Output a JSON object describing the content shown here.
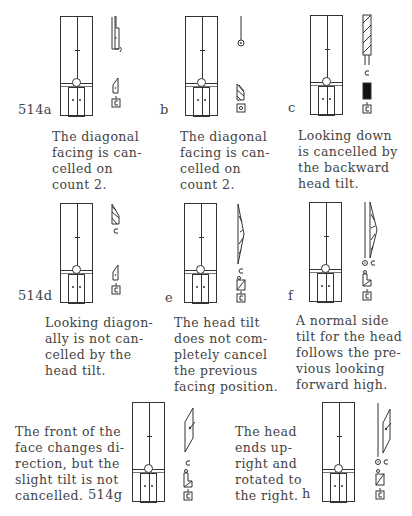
{
  "page": {
    "top_cut_text": "…",
    "figures": [
      {
        "id": "a",
        "label": "514a",
        "caption": "The diagonal\nfacing is can-\ncelled on\ncount 2."
      },
      {
        "id": "b",
        "label": "b",
        "caption": "The diagonal\nfacing is can-\ncelled on\ncount 2."
      },
      {
        "id": "c",
        "label": "c",
        "caption": "Looking down\nis cancelled by\nthe backward\nhead tilt."
      },
      {
        "id": "d",
        "label": "514d",
        "caption": "Looking diagon-\nally is not can-\ncelled by the\nhead tilt."
      },
      {
        "id": "e",
        "label": "e",
        "caption": "The head tilt\ndoes not com-\npletely cancel\nthe previous\nfacing position."
      },
      {
        "id": "f",
        "label": "f",
        "caption": "A normal side\ntilt for the head\nfollows the pre-\nvious looking\nforward high."
      },
      {
        "id": "g",
        "label": "514g",
        "caption": "The front of the\nface changes di-\nrection, but the\nslight tilt is not\ncancelled."
      },
      {
        "id": "h",
        "label": "h",
        "caption": "The head\nends up-\nright and\nrotated to\nthe right."
      }
    ]
  }
}
